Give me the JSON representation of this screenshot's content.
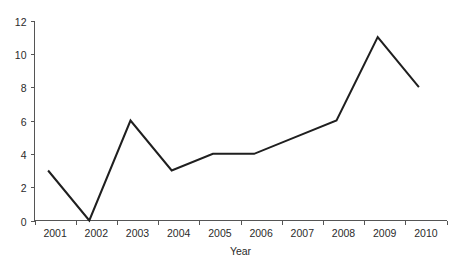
{
  "chart_data": {
    "type": "line",
    "title": "",
    "subtitle": "",
    "xlabel": "Year",
    "ylabel": "",
    "categories": [
      "2001",
      "2002",
      "2003",
      "2004",
      "2005",
      "2006",
      "2007",
      "2008",
      "2009",
      "2010"
    ],
    "values": [
      3,
      0,
      6,
      3,
      4,
      4,
      5,
      6,
      11,
      8
    ],
    "series": [
      {
        "name": "",
        "values": [
          3,
          0,
          6,
          3,
          4,
          4,
          5,
          6,
          11,
          8
        ]
      }
    ],
    "ylim": [
      0,
      12
    ],
    "y_ticks": [
      0,
      2,
      4,
      6,
      8,
      10,
      12
    ],
    "y_tick_labels": [
      "0",
      "2",
      "4",
      "6",
      "8",
      "10",
      "12"
    ],
    "x_tick_labels": [
      "2001",
      "2002",
      "2003",
      "2004",
      "2005",
      "2006",
      "2007",
      "2008",
      "2009",
      "2010"
    ],
    "grid": false,
    "legend": false,
    "legend_position": "none",
    "markers": false,
    "line_color": "#1f1f1f",
    "axis_color": "#555555",
    "text_color": "#2b2b2b",
    "background_color": "#ffffff"
  },
  "axes": {
    "y_axis_name": "value-axis",
    "x_axis_name": "year-axis",
    "x_title": "Year"
  }
}
